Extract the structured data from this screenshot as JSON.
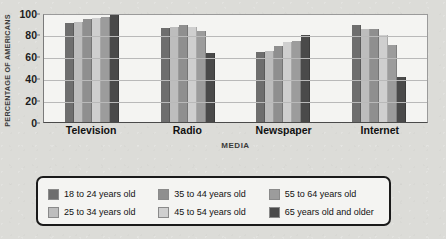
{
  "chart_data": {
    "type": "bar",
    "title": "",
    "xlabel": "MEDIA",
    "ylabel": "PERCENTAGE OF AMERICANS",
    "ylim": [
      0,
      100
    ],
    "yticks": [
      0,
      20,
      40,
      60,
      80,
      100
    ],
    "grid": true,
    "legend_position": "bottom",
    "categories": [
      "Television",
      "Radio",
      "Newspaper",
      "Internet"
    ],
    "series": [
      {
        "name": "18 to 24 years old",
        "color": "#6e6e6e",
        "values": [
          90,
          86,
          64,
          89
        ]
      },
      {
        "name": "25 to 34 years old",
        "color": "#bdbdbd",
        "values": [
          91,
          87,
          65,
          85
        ]
      },
      {
        "name": "35 to 44 years old",
        "color": "#8f8f8f",
        "values": [
          94,
          89,
          69,
          85
        ]
      },
      {
        "name": "45 to 54 years old",
        "color": "#cfcfcf",
        "values": [
          95,
          87,
          73,
          79
        ]
      },
      {
        "name": "55 to 64 years old",
        "color": "#9c9c9c",
        "values": [
          96,
          83,
          74,
          70
        ]
      },
      {
        "name": "65 years old and older",
        "color": "#4a4a4a",
        "values": [
          98,
          63,
          79,
          41
        ]
      }
    ]
  },
  "axis": {
    "y_title": "PERCENTAGE OF AMERICANS",
    "x_title": "MEDIA",
    "tick_labels": [
      "100",
      "80",
      "60",
      "40",
      "20",
      "0"
    ]
  },
  "legend": {
    "items": [
      {
        "label": "18 to 24 years old"
      },
      {
        "label": "35 to 44 years old"
      },
      {
        "label": "55 to 64 years old"
      },
      {
        "label": "25 to 34 years old"
      },
      {
        "label": "45 to 54 years old"
      },
      {
        "label": "65 years old and older"
      }
    ]
  }
}
